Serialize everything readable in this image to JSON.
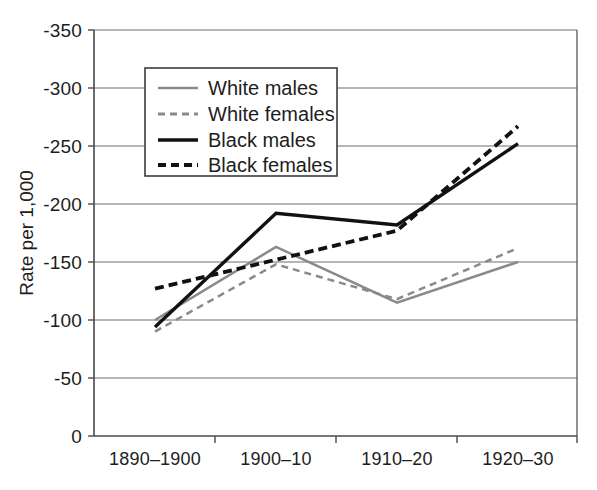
{
  "chart_data": {
    "type": "line",
    "title": "",
    "xlabel": "",
    "ylabel": "Rate per 1,000",
    "categories": [
      "1890–1900",
      "1900–10",
      "1910–20",
      "1920–30"
    ],
    "ylim": [
      0,
      350
    ],
    "y_axis_inverted": true,
    "y_ticks": [
      0,
      50,
      100,
      150,
      200,
      250,
      300,
      350
    ],
    "y_tick_labels": [
      "0",
      "-50",
      "-100",
      "-150",
      "-200",
      "-250",
      "-300",
      "-350"
    ],
    "grid": true,
    "grid_axis": "y",
    "legend_position": "upper-left-inside",
    "series": [
      {
        "name": "White males",
        "values": [
          100,
          163,
          115,
          150
        ],
        "color": "#8a8a8a",
        "style": "solid",
        "width": 2.5
      },
      {
        "name": "White females",
        "values": [
          90,
          148,
          118,
          162
        ],
        "color": "#8a8a8a",
        "style": "dashed",
        "width": 2.5
      },
      {
        "name": "Black males",
        "values": [
          94,
          192,
          182,
          252
        ],
        "color": "#111111",
        "style": "solid",
        "width": 3.4
      },
      {
        "name": "Black females",
        "values": [
          127,
          152,
          177,
          267
        ],
        "color": "#111111",
        "style": "dashed",
        "width": 3.8
      }
    ]
  },
  "axis": {
    "y_title": "Rate per 1,000",
    "y_labels": {
      "t350": "-350",
      "t300": "-300",
      "t250": "-250",
      "t200": "-200",
      "t150": "-150",
      "t100": "-100",
      "t50": "-50",
      "t0": "0"
    },
    "x_labels": {
      "c0": "1890–1900",
      "c1": "1900–10",
      "c2": "1910–20",
      "c3": "1920–30"
    }
  },
  "legend": {
    "entries": [
      {
        "label": "White males",
        "color": "#8a8a8a",
        "style": "solid"
      },
      {
        "label": "White females",
        "color": "#8a8a8a",
        "style": "dashed"
      },
      {
        "label": "Black males",
        "color": "#111111",
        "style": "solid"
      },
      {
        "label": "Black females",
        "color": "#111111",
        "style": "dashed"
      }
    ]
  },
  "colors": {
    "white_series": "#8a8a8a",
    "black_series": "#111111",
    "grid": "#6f6f6f",
    "axis": "#4a4a4a",
    "background": "#ffffff"
  }
}
